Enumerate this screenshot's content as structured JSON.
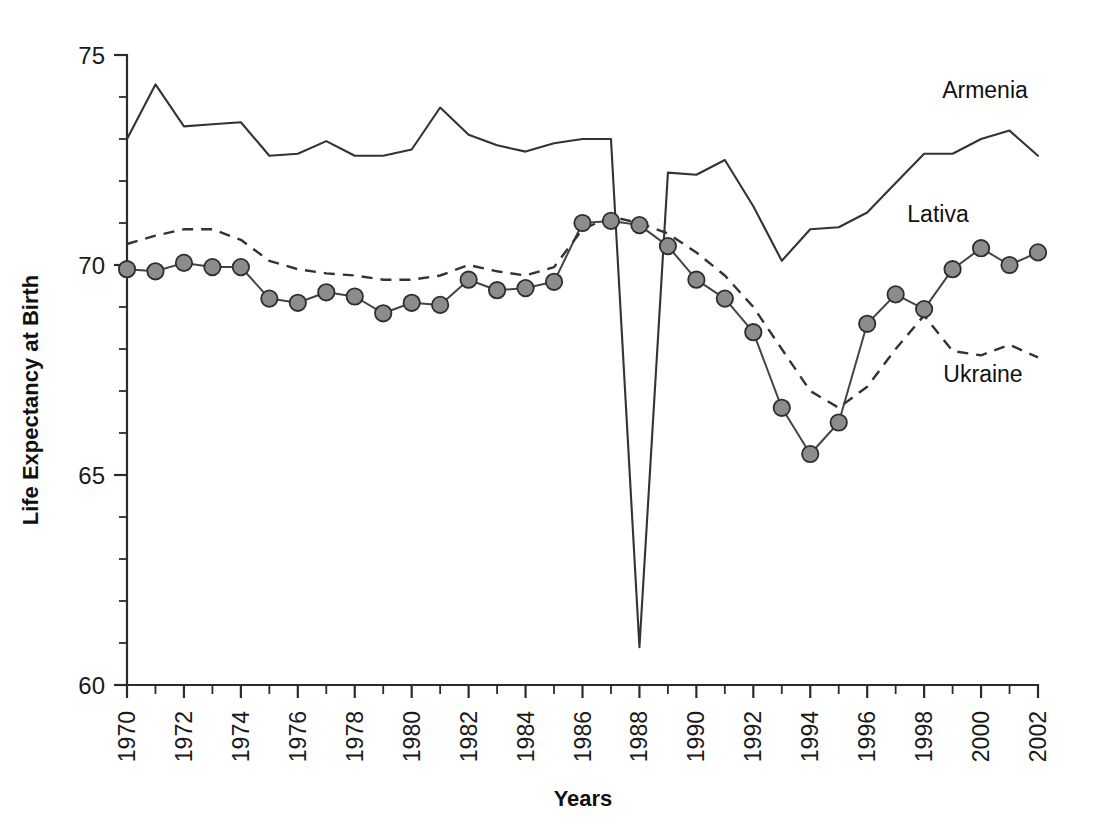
{
  "chart_data": {
    "type": "line",
    "title": "",
    "xlabel": "Years",
    "ylabel": "Life Expectancy at Birth",
    "xlim": [
      1970,
      2002
    ],
    "ylim": [
      60,
      75
    ],
    "y_major_ticks": [
      60,
      65,
      70,
      75
    ],
    "y_minor_tick_step": 1,
    "x_major_tick_step": 1,
    "x_tick_label_step": 2,
    "grid": false,
    "legend_position": "inline-annotations",
    "x": [
      1970,
      1971,
      1972,
      1973,
      1974,
      1975,
      1976,
      1977,
      1978,
      1979,
      1980,
      1981,
      1982,
      1983,
      1984,
      1985,
      1986,
      1987,
      1988,
      1989,
      1990,
      1991,
      1992,
      1993,
      1994,
      1995,
      1996,
      1997,
      1998,
      1999,
      2000,
      2001,
      2002
    ],
    "x_tick_labels": [
      "1970",
      "1972",
      "1974",
      "1976",
      "1978",
      "1980",
      "1982",
      "1984",
      "1986",
      "1988",
      "1990",
      "1992",
      "1994",
      "1996",
      "1998",
      "2000",
      "2002"
    ],
    "y_tick_labels": [
      "60",
      "65",
      "70",
      "75"
    ],
    "series": [
      {
        "name": "Armenia",
        "style": "solid",
        "markers": false,
        "color": "#333333",
        "annotation_label": "Armenia",
        "values": [
          73.0,
          74.3,
          73.3,
          73.35,
          73.4,
          72.6,
          72.65,
          72.95,
          72.6,
          72.6,
          72.75,
          73.75,
          73.1,
          72.85,
          72.7,
          72.9,
          73.0,
          73.0,
          60.9,
          72.2,
          72.15,
          72.5,
          71.4,
          70.1,
          70.85,
          70.9,
          71.25,
          71.95,
          72.65,
          72.65,
          73.0,
          73.2,
          72.6
        ]
      },
      {
        "name": "Lativa",
        "style": "solid",
        "markers": true,
        "color": "#444444",
        "marker_fill": "#8c8c8c",
        "marker_stroke": "#2e2e2e",
        "annotation_label": "Lativa",
        "values": [
          69.9,
          69.85,
          70.05,
          69.95,
          69.95,
          69.2,
          69.1,
          69.35,
          69.25,
          68.85,
          69.1,
          69.05,
          69.65,
          69.4,
          69.45,
          69.6,
          71.0,
          71.05,
          70.95,
          70.45,
          69.65,
          69.2,
          68.4,
          66.6,
          65.5,
          66.25,
          68.6,
          69.3,
          68.95,
          69.9,
          70.4,
          70.0,
          70.3
        ]
      },
      {
        "name": "Ukraine",
        "style": "dashed",
        "markers": false,
        "color": "#333333",
        "annotation_label": "Ukraine",
        "values": [
          70.5,
          70.7,
          70.85,
          70.85,
          70.6,
          70.1,
          69.9,
          69.8,
          69.75,
          69.65,
          69.65,
          69.75,
          70.0,
          69.85,
          69.75,
          69.95,
          70.85,
          71.15,
          71.0,
          70.75,
          70.3,
          69.75,
          69.0,
          68.0,
          67.0,
          66.6,
          67.1,
          68.0,
          68.8,
          67.95,
          67.85,
          68.1,
          67.8
        ]
      }
    ],
    "annotations": [
      {
        "text": "Armenia",
        "x_pixel": 985,
        "y_pixel": 98
      },
      {
        "text": "Lativa",
        "x_pixel": 938,
        "y_pixel": 222
      },
      {
        "text": "Ukraine",
        "x_pixel": 983,
        "y_pixel": 382
      }
    ]
  }
}
